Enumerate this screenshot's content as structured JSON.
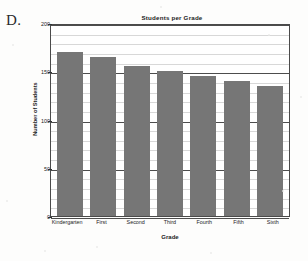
{
  "figure": {
    "letter": "D."
  },
  "chart_data": {
    "type": "bar",
    "title": "Students per Grade",
    "xlabel": "Grade",
    "ylabel": "Number of Students",
    "categories": [
      "Kindergarten",
      "First",
      "Second",
      "Third",
      "Fourth",
      "Fifth",
      "Sixth"
    ],
    "values": [
      170,
      165,
      155,
      150,
      145,
      140,
      135
    ],
    "ylim": [
      0,
      200
    ],
    "yticks": [
      0,
      50,
      100,
      150,
      200
    ],
    "ytick_labels": [
      "0",
      "50",
      "100",
      "150",
      "200"
    ],
    "minor_tick_step": 10,
    "grid": true,
    "legend": false,
    "bar_color": "#767676",
    "axis_color": "#4a4a4a",
    "major_gridline_color": "#4d4d4d",
    "minor_gridline_color": "#d8d8d8"
  }
}
